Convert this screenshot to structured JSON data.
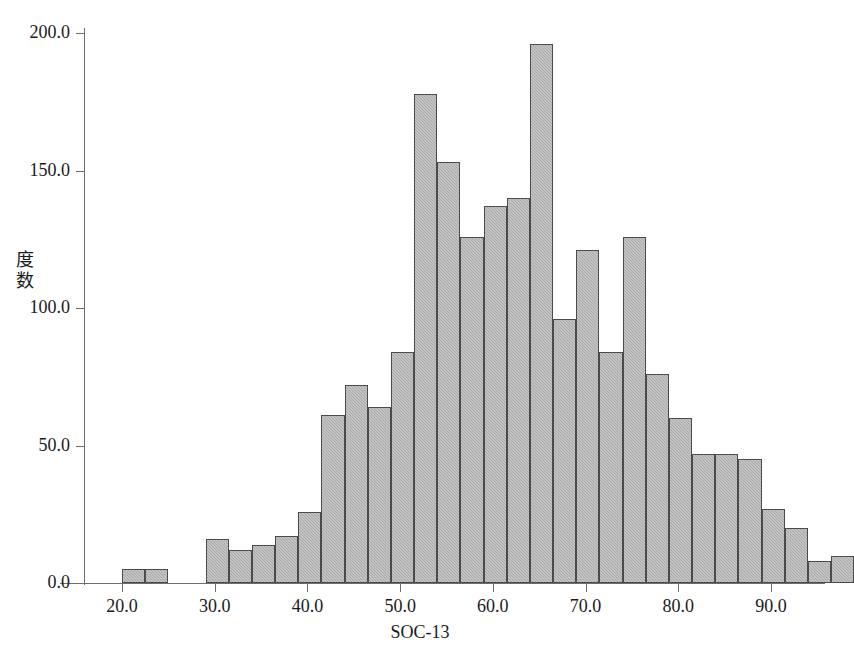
{
  "chart_data": {
    "type": "bar",
    "title": "",
    "subtitle": "",
    "xlabel": "SOC-13",
    "ylabel": "度数",
    "xlim": [
      16.0,
      94.0
    ],
    "ylim": [
      0.0,
      200.0
    ],
    "grid": false,
    "legend": null,
    "bin_width": 2.5,
    "x_ticks": [
      "20.0",
      "30.0",
      "40.0",
      "50.0",
      "60.0",
      "70.0",
      "80.0",
      "90.0"
    ],
    "x_tick_values": [
      20.0,
      30.0,
      40.0,
      50.0,
      60.0,
      70.0,
      80.0,
      90.0
    ],
    "y_ticks": [
      "0.0",
      "50.0",
      "100.0",
      "150.0",
      "200.0"
    ],
    "y_tick_values": [
      0,
      50,
      100,
      150,
      200
    ],
    "bar_fill_color": "#a9a9a9",
    "bar_edge_color": "#4b4b4b",
    "axis_color": "#6e6e6e",
    "background_color": "#ffffff",
    "bins": [
      {
        "x0": 20.0,
        "x1": 22.5,
        "value": 5
      },
      {
        "x0": 22.5,
        "x1": 25.0,
        "value": 5
      },
      {
        "x0": 29.0,
        "x1": 31.5,
        "value": 16
      },
      {
        "x0": 31.5,
        "x1": 34.0,
        "value": 12
      },
      {
        "x0": 34.0,
        "x1": 36.5,
        "value": 14
      },
      {
        "x0": 36.5,
        "x1": 39.0,
        "value": 17
      },
      {
        "x0": 39.0,
        "x1": 41.5,
        "value": 26
      },
      {
        "x0": 41.5,
        "x1": 44.0,
        "value": 61
      },
      {
        "x0": 44.0,
        "x1": 46.5,
        "value": 72
      },
      {
        "x0": 46.5,
        "x1": 49.0,
        "value": 64
      },
      {
        "x0": 49.0,
        "x1": 51.5,
        "value": 84
      },
      {
        "x0": 51.5,
        "x1": 54.0,
        "value": 178
      },
      {
        "x0": 54.0,
        "x1": 56.5,
        "value": 153
      },
      {
        "x0": 56.5,
        "x1": 59.0,
        "value": 126
      },
      {
        "x0": 59.0,
        "x1": 61.5,
        "value": 137
      },
      {
        "x0": 61.5,
        "x1": 64.0,
        "value": 140
      },
      {
        "x0": 64.0,
        "x1": 66.5,
        "value": 196
      },
      {
        "x0": 66.5,
        "x1": 69.0,
        "value": 96
      },
      {
        "x0": 69.0,
        "x1": 71.5,
        "value": 121
      },
      {
        "x0": 71.5,
        "x1": 74.0,
        "value": 84
      },
      {
        "x0": 74.0,
        "x1": 76.5,
        "value": 126
      },
      {
        "x0": 76.5,
        "x1": 79.0,
        "value": 76
      },
      {
        "x0": 79.0,
        "x1": 81.5,
        "value": 60
      },
      {
        "x0": 81.5,
        "x1": 84.0,
        "value": 47
      },
      {
        "x0": 84.0,
        "x1": 86.5,
        "value": 47
      },
      {
        "x0": 86.5,
        "x1": 89.0,
        "value": 45
      },
      {
        "x0": 89.0,
        "x1": 91.5,
        "value": 27
      },
      {
        "x0": 91.5,
        "x1": 94.0,
        "value": 20
      },
      {
        "x0": 94.0,
        "x1": 96.5,
        "value": 8
      },
      {
        "x0": 96.5,
        "x1": 99.0,
        "value": 10
      }
    ]
  }
}
